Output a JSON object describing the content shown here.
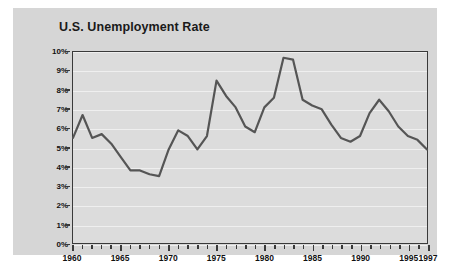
{
  "chart_data": {
    "type": "line",
    "title": "U.S. Unemployment Rate",
    "xlabel": "",
    "ylabel": "",
    "ylim": [
      0,
      10
    ],
    "xlim": [
      1960,
      1997
    ],
    "grid": true,
    "legend": "none",
    "y_ticks": [
      "10%",
      "9%",
      "8%",
      "7%",
      "6%",
      "5%",
      "4%",
      "3%",
      "2%",
      "1%",
      "0%"
    ],
    "y_tick_values": [
      10,
      9,
      8,
      7,
      6,
      5,
      4,
      3,
      2,
      1,
      0
    ],
    "x_tick_labels": [
      "1960",
      "1965",
      "1970",
      "1975",
      "1980",
      "1985",
      "1990",
      "1995",
      "1997"
    ],
    "x_tick_values": [
      1960,
      1965,
      1970,
      1975,
      1980,
      1985,
      1990,
      1995,
      1997
    ],
    "series_name": "Unemployment Rate",
    "x": [
      1960,
      1961,
      1962,
      1963,
      1964,
      1965,
      1966,
      1967,
      1968,
      1969,
      1970,
      1971,
      1972,
      1973,
      1974,
      1975,
      1976,
      1977,
      1978,
      1979,
      1980,
      1981,
      1982,
      1983,
      1984,
      1985,
      1986,
      1987,
      1988,
      1989,
      1990,
      1991,
      1992,
      1993,
      1994,
      1995,
      1996,
      1997
    ],
    "values": [
      5.5,
      6.7,
      5.5,
      5.7,
      5.2,
      4.5,
      3.8,
      3.8,
      3.6,
      3.5,
      4.9,
      5.9,
      5.6,
      4.9,
      5.6,
      8.5,
      7.7,
      7.1,
      6.1,
      5.8,
      7.1,
      7.6,
      9.7,
      9.6,
      7.5,
      7.2,
      7.0,
      6.2,
      5.5,
      5.3,
      5.6,
      6.8,
      7.5,
      6.9,
      6.1,
      5.6,
      5.4,
      4.9
    ]
  },
  "colors": {
    "line": "#555555",
    "card_background": "#d6d6d6",
    "plot_background": "#dcdcdc",
    "axis": "#3a3a3a",
    "gridline": "#efefef",
    "text": "#111111"
  }
}
